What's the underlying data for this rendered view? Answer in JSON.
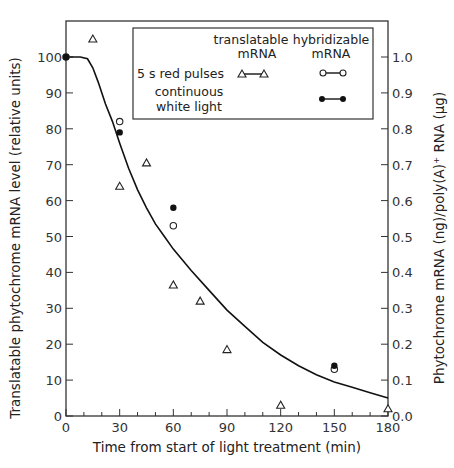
{
  "chart_data": {
    "type": "scatter",
    "title": "",
    "xlabel": "Time from start of light treatment (min)",
    "ylabel": "Translatable phytochrome mRNA level (relative units)",
    "ylabel_right": "Phytochrome mRNA (ng)/poly(A)+ RNA (μg)",
    "xlim": [
      0,
      180
    ],
    "ylim": [
      0,
      100
    ],
    "ylim_right": [
      0.0,
      1.0
    ],
    "x_ticks": [
      0,
      30,
      60,
      90,
      120,
      150,
      180
    ],
    "x_minor_step": 10,
    "y_ticks": [
      0,
      10,
      20,
      30,
      40,
      50,
      60,
      70,
      80,
      90,
      100
    ],
    "y_ticks_right": [
      "0.0",
      "0.1",
      "0.2",
      "0.3",
      "0.4",
      "0.5",
      "0.6",
      "0.7",
      "0.8",
      "0.9",
      "1.0"
    ],
    "grid": false,
    "legend_position": "upper right (inside)",
    "legend": {
      "col_headers": [
        "translatable mRNA",
        "hybridizable mRNA"
      ],
      "rows": [
        {
          "label": "5 s red pulses",
          "translatable": "open triangle",
          "hybridizable": "open circle"
        },
        {
          "label": "continuous white light",
          "translatable": null,
          "hybridizable": "filled circle"
        }
      ]
    },
    "series": [
      {
        "name": "translatable mRNA, 5 s red pulses",
        "marker": "open-triangle",
        "axis": "left",
        "points": [
          [
            15,
            105
          ],
          [
            30,
            64
          ],
          [
            45,
            70.5
          ],
          [
            60,
            36.5
          ],
          [
            75,
            32
          ],
          [
            90,
            18.5
          ],
          [
            120,
            3
          ],
          [
            180,
            2
          ]
        ]
      },
      {
        "name": "hybridizable mRNA, 5 s red pulses",
        "marker": "open-circle",
        "axis": "right",
        "points": [
          [
            0,
            1.0
          ],
          [
            30,
            0.82
          ],
          [
            60,
            0.53
          ],
          [
            150,
            0.13
          ]
        ]
      },
      {
        "name": "hybridizable mRNA, continuous white light",
        "marker": "filled-circle",
        "axis": "right",
        "points": [
          [
            0,
            1.0
          ],
          [
            30,
            0.79
          ],
          [
            60,
            0.58
          ],
          [
            150,
            0.14
          ]
        ]
      },
      {
        "name": "fitted curve",
        "marker": "line",
        "axis": "left",
        "points": [
          [
            0,
            100
          ],
          [
            8,
            100
          ],
          [
            12,
            99.5
          ],
          [
            15,
            97
          ],
          [
            18,
            93
          ],
          [
            22,
            87
          ],
          [
            26,
            82
          ],
          [
            30,
            76
          ],
          [
            35,
            69
          ],
          [
            40,
            63
          ],
          [
            45,
            58
          ],
          [
            50,
            53.5
          ],
          [
            55,
            50
          ],
          [
            60,
            46.5
          ],
          [
            70,
            40.5
          ],
          [
            80,
            35
          ],
          [
            90,
            29.5
          ],
          [
            100,
            25
          ],
          [
            110,
            20.5
          ],
          [
            120,
            17
          ],
          [
            130,
            14
          ],
          [
            140,
            11.5
          ],
          [
            150,
            9.5
          ],
          [
            160,
            8
          ],
          [
            170,
            6.5
          ],
          [
            180,
            5
          ]
        ]
      }
    ]
  },
  "labels": {
    "legend_col1_line1": "translatable",
    "legend_col1_line2": "mRNA",
    "legend_col2_line1": "hybridizable",
    "legend_col2_line2": "mRNA",
    "legend_row1": "5 s red pulses",
    "legend_row2_line1": "continuous",
    "legend_row2_line2": "white light",
    "xlabel": "Time from start of light treatment (min)",
    "ylabel": "Translatable phytochrome mRNA level (relative units)",
    "ylabel_right": "Phytochrome mRNA (ng)/poly(A)⁺ RNA (μg)"
  }
}
